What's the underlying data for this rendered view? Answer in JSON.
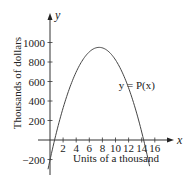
{
  "chart_data": {
    "type": "line",
    "title": "",
    "xlabel": "Units of a thousand",
    "ylabel": "Thousands of dollars",
    "x_axis_letter": "x",
    "y_axis_letter": "y",
    "xlim": [
      0,
      17
    ],
    "ylim": [
      -450,
      1100
    ],
    "x_ticks": [
      2,
      4,
      6,
      8,
      10,
      12,
      14,
      16
    ],
    "y_ticks": [
      -200,
      200,
      400,
      600,
      800,
      1000
    ],
    "grid": false,
    "series": [
      {
        "name": "y = P(x)",
        "function": "quadratic",
        "vertex": [
          7.5,
          950
        ],
        "roots": [
          0.7,
          14.3
        ],
        "x_range": [
          -0.3,
          15.2
        ]
      }
    ],
    "annotations": [
      {
        "text": "y = P(x)",
        "x": 10.5,
        "y": 520
      }
    ]
  }
}
